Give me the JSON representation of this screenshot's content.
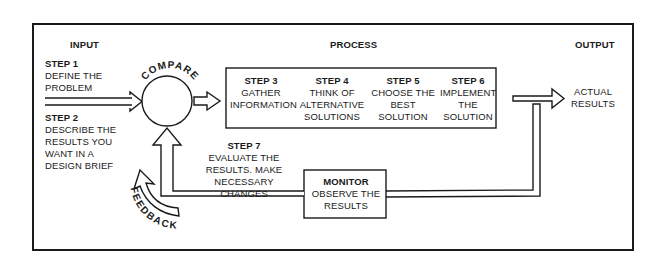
{
  "sections": {
    "input": "INPUT",
    "process": "PROCESS",
    "output": "OUTPUT"
  },
  "input_steps": [
    {
      "step": "STEP 1",
      "lines": [
        "DEFINE THE",
        "PROBLEM"
      ]
    },
    {
      "step": "STEP 2",
      "lines": [
        "DESCRIBE THE",
        "RESULTS YOU",
        "WANT IN A",
        "DESIGN BRIEF"
      ]
    }
  ],
  "compare_label": "COMPARE",
  "process_steps": [
    {
      "step": "STEP 3",
      "lines": [
        "GATHER",
        "INFORMATION"
      ]
    },
    {
      "step": "STEP 4",
      "lines": [
        "THINK OF",
        "ALTERNATIVE",
        "SOLUTIONS"
      ]
    },
    {
      "step": "STEP 5",
      "lines": [
        "CHOOSE THE",
        "BEST",
        "SOLUTION"
      ]
    },
    {
      "step": "STEP 6",
      "lines": [
        "IMPLEMENT",
        "THE",
        "SOLUTION"
      ]
    }
  ],
  "output_result": {
    "lines": [
      "ACTUAL",
      "RESULTS"
    ]
  },
  "evaluate_step": {
    "step": "STEP 7",
    "lines": [
      "EVALUATE THE",
      "RESULTS.  MAKE",
      "NECESSARY CHANGES"
    ]
  },
  "monitor": {
    "title": "MONITOR",
    "lines": [
      "OBSERVE THE",
      "RESULTS"
    ]
  },
  "feedback_label": "FEEDBACK",
  "colors": {
    "ink": "#1a1a1a",
    "background": "#ffffff"
  }
}
